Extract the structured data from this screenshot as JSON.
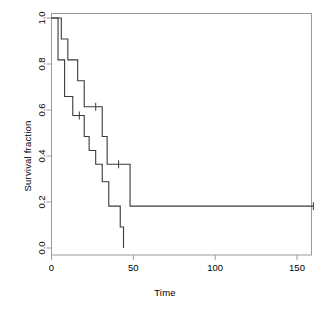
{
  "chart_data": {
    "type": "line",
    "title": "",
    "xlabel": "Time",
    "ylabel": "Survival fraction",
    "xlim": [
      0,
      163
    ],
    "ylim": [
      0.0,
      1.0
    ],
    "grid": false,
    "legend": "none",
    "xticks": [
      0,
      50,
      100,
      150
    ],
    "xtick_labels": [
      "0",
      "50",
      "100",
      "150"
    ],
    "yticks": [
      0.0,
      0.2,
      0.4,
      0.6,
      0.8,
      1.0
    ],
    "ytick_labels": [
      "0.0",
      "0.2",
      "0.4",
      "0.6",
      "0.8",
      "1.0"
    ],
    "series": [
      {
        "name": "upper-curve",
        "style": "step-post",
        "x": [
          0,
          6,
          10,
          16,
          20,
          27,
          31,
          34,
          48,
          160
        ],
        "y": [
          1.0,
          1.0,
          0.909,
          0.818,
          0.727,
          0.614,
          0.614,
          0.485,
          0.364,
          0.182
        ],
        "steps": [
          {
            "time": 0,
            "fraction": 1.0
          },
          {
            "time": 6,
            "fraction": 0.909
          },
          {
            "time": 10,
            "fraction": 0.818
          },
          {
            "time": 16,
            "fraction": 0.727
          },
          {
            "time": 20,
            "fraction": 0.614
          },
          {
            "time": 31,
            "fraction": 0.485
          },
          {
            "time": 34,
            "fraction": 0.364
          },
          {
            "time": 48,
            "fraction": 0.182
          },
          {
            "time": 160,
            "fraction": 0.182
          }
        ],
        "censored": [
          {
            "time": 27,
            "fraction": 0.614
          },
          {
            "time": 41,
            "fraction": 0.364
          },
          {
            "time": 160,
            "fraction": 0.182
          }
        ]
      },
      {
        "name": "lower-curve",
        "style": "step-post",
        "x": [
          0,
          4,
          8,
          13,
          18,
          23,
          27,
          31,
          37,
          41,
          44
        ],
        "y": [
          1.0,
          0.818,
          0.659,
          0.576,
          0.485,
          0.424,
          0.364,
          0.288,
          0.182,
          0.091,
          0.0
        ],
        "steps": [
          {
            "time": 0,
            "fraction": 1.0
          },
          {
            "time": 4,
            "fraction": 0.818
          },
          {
            "time": 8,
            "fraction": 0.659
          },
          {
            "time": 13,
            "fraction": 0.576
          },
          {
            "time": 20,
            "fraction": 0.485
          },
          {
            "time": 23,
            "fraction": 0.424
          },
          {
            "time": 27,
            "fraction": 0.364
          },
          {
            "time": 31,
            "fraction": 0.288
          },
          {
            "time": 35,
            "fraction": 0.182
          },
          {
            "time": 42,
            "fraction": 0.091
          },
          {
            "time": 44,
            "fraction": 0.0
          }
        ],
        "censored": [
          {
            "time": 17,
            "fraction": 0.576
          }
        ]
      }
    ]
  },
  "axes": {
    "x_title": "Time",
    "y_title": "Survival fraction",
    "x_tick_labels": [
      "0",
      "50",
      "100",
      "150"
    ],
    "y_tick_labels": [
      "0.0",
      "0.2",
      "0.4",
      "0.6",
      "0.8",
      "1.0"
    ]
  },
  "style": {
    "line_color": "#3a3a3a",
    "axis_color": "#9a9a9a",
    "background": "#ffffff"
  }
}
